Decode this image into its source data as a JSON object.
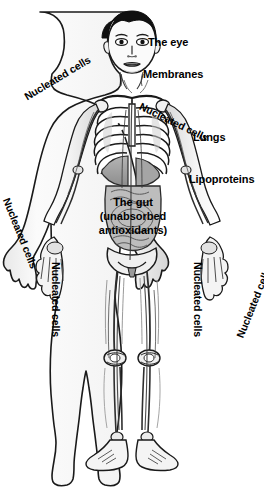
{
  "diagram": {
    "colors": {
      "background": "#ffffff",
      "outline": "#1a1a1a",
      "skin": "#f2f2f2",
      "hair": "#1a1a1a",
      "bone": "#ffffff",
      "organ_shade": "#9a9a9a",
      "muscle_shade": "#c9c9c9",
      "vessel": "#3a3a3a",
      "label_text": "#000000"
    },
    "labels": {
      "eye": "The eye",
      "membranes": "Membranes",
      "lungs": "Lungs",
      "lipoproteins": "Lipoproteins",
      "nucleated_cells": "Nucleated cells"
    },
    "gut_label": {
      "line1": "The gut",
      "line2": "(unabsorbed",
      "line3": "antioxidants)"
    },
    "nucleated_cells_instances": [
      {
        "position": "upper-left-shoulder",
        "rotation_deg": -31
      },
      {
        "position": "upper-right-shoulder",
        "rotation_deg": 26
      },
      {
        "position": "lower-left-forearm",
        "rotation_deg": 68
      },
      {
        "position": "lower-right-forearm",
        "rotation_deg": -68
      },
      {
        "position": "left-thigh",
        "rotation_deg": 90
      },
      {
        "position": "right-thigh",
        "rotation_deg": 90
      }
    ]
  }
}
